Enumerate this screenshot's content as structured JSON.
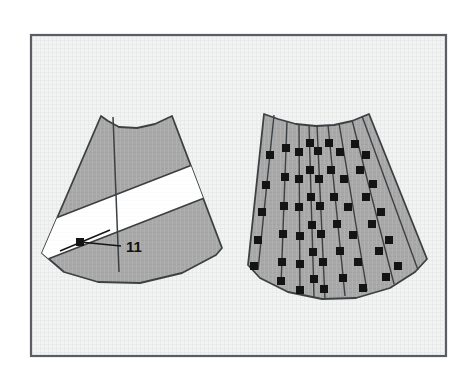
{
  "figure": {
    "frame": {
      "name": "diagram-border",
      "x": 30,
      "y": 34,
      "width": 417,
      "height": 323,
      "background_color": "#f1f2f1",
      "border_color": "#5a5e63",
      "border_width": 2
    },
    "colors": {
      "panel_fill": "#a9a9a9",
      "panel_fill_right": "#ababab",
      "panel_stroke": "#3d4043",
      "band_fill": "#ffffff",
      "marker_fill": "#141414",
      "leader_line": "#141414",
      "label_text": "#111111",
      "page_background": "#ffffff"
    },
    "left_panel": {
      "name": "left-fan-panel",
      "description": "Gray fan-shaped panel crossed by a white diagonal band",
      "outline": "M 101 116 L 42 253 L 64 272 L 98 282 L 140 283 L 182 273 L 216 255 L 222 248 L 172 116 L 155 124 L 137 128 L 119 127 L 108 121 Z",
      "top_arc": "M 101 116 L 108 121 L 119 127 L 137 128 L 155 124 L 172 116",
      "bottom_arc": "M 42 253 L 64 272 L 98 282 L 140 283 L 182 273 L 216 255 L 222 248",
      "radial_line": "M 113 117 L 119 272",
      "white_band": "M 47 219 L 193 161 L 190 192 L 43 251 Z",
      "marker": {
        "x": 80,
        "y": 242,
        "size": 8
      },
      "cross_line_a": {
        "x1": 62,
        "y1": 250,
        "x2": 108,
        "y2": 231
      },
      "leader_line": {
        "x1": 80,
        "y1": 242,
        "x2": 122,
        "y2": 246
      },
      "callout_label": "11",
      "callout_label_x": 126,
      "callout_label_y": 247
    },
    "right_panel": {
      "name": "right-fan-panel",
      "description": "Gray fan-shaped panel with nine radial seam lines carrying square markers",
      "outline": "M 264 114 L 248 265 L 260 278 L 288 292 L 322 299 L 356 298 L 390 288 L 415 272 L 427 259 L 369 114 L 352 121 L 334 125 L 316 126 L 296 124 L 278 119 Z",
      "top_arc": "M 264 114 L 278 119 L 296 124 L 316 126 L 334 125 L 352 121 L 369 114",
      "bottom_arc": "M 248 265 L 260 278 L 288 292 L 322 299 L 356 298 L 390 288 L 415 272 L 427 259",
      "seam_count": 9,
      "seams": [
        {
          "name": "seam-1",
          "path": "M 274 115 L 258 270",
          "markers": [
            [
              270,
              155
            ],
            [
              266,
              185
            ],
            [
              262,
              212
            ],
            [
              258,
              240
            ],
            [
              254,
              266
            ]
          ]
        },
        {
          "name": "seam-2",
          "path": "M 287 121 L 281 284",
          "markers": [
            [
              286,
              148
            ],
            [
              285,
              177
            ],
            [
              284,
              206
            ],
            [
              283,
              234
            ],
            [
              282,
              262
            ],
            [
              281,
              281
            ]
          ]
        },
        {
          "name": "seam-3",
          "path": "M 299 124 L 300 293",
          "markers": [
            [
              299,
              152
            ],
            [
              299,
              179
            ],
            [
              299,
              207
            ],
            [
              300,
              236
            ],
            [
              300,
              264
            ],
            [
              300,
              290
            ]
          ]
        },
        {
          "name": "seam-4",
          "path": "M 309 125 L 314 296",
          "markers": [
            [
              310,
              143
            ],
            [
              310,
              170
            ],
            [
              311,
              197
            ],
            [
              312,
              225
            ],
            [
              313,
              252
            ],
            [
              314,
              279
            ]
          ]
        },
        {
          "name": "seam-5",
          "path": "M 317 126 L 325 298",
          "markers": [
            [
              318,
              151
            ],
            [
              319,
              179
            ],
            [
              320,
              206
            ],
            [
              321,
              234
            ],
            [
              323,
              262
            ],
            [
              324,
              289
            ]
          ]
        },
        {
          "name": "seam-6",
          "path": "M 328 125 L 345 296",
          "markers": [
            [
              329,
              143
            ],
            [
              331,
              170
            ],
            [
              334,
              197
            ],
            [
              337,
              224
            ],
            [
              340,
              251
            ],
            [
              343,
              278
            ]
          ]
        },
        {
          "name": "seam-7",
          "path": "M 339 123 L 367 290",
          "markers": [
            [
              340,
              152
            ],
            [
              344,
              179
            ],
            [
              348,
              207
            ],
            [
              353,
              235
            ],
            [
              358,
              262
            ],
            [
              363,
              288
            ]
          ]
        },
        {
          "name": "seam-8",
          "path": "M 352 120 L 394 283",
          "markers": [
            [
              355,
              144
            ],
            [
              360,
              170
            ],
            [
              366,
              197
            ],
            [
              372,
              224
            ],
            [
              379,
              251
            ],
            [
              386,
              277
            ]
          ]
        },
        {
          "name": "seam-9",
          "path": "M 362 116 L 418 269",
          "markers": [
            [
              366,
              155
            ],
            [
              373,
              184
            ],
            [
              381,
              212
            ],
            [
              389,
              240
            ],
            [
              398,
              266
            ]
          ]
        }
      ],
      "marker_size": 8
    }
  }
}
